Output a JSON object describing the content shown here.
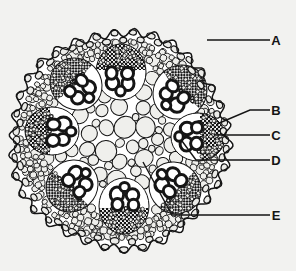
{
  "figure": {
    "background_color": "#f2f2f0",
    "ink_color": "#151515",
    "stem": {
      "center_x": 119,
      "center_y": 140,
      "radius": 108,
      "outline_lobes": 34,
      "lobe_amplitude": 4
    },
    "tissues": [
      {
        "name": "epidermis",
        "description": "outer ring of small flattened cells",
        "cell_count": 74
      },
      {
        "name": "cortex",
        "description": "band of small rounded parenchyma cells beneath epidermis"
      },
      {
        "name": "ground-tissue",
        "description": "large rounded parenchyma cells filling interior"
      },
      {
        "name": "pith",
        "description": "central region of largest parenchyma cells"
      }
    ],
    "vascular_bundles": {
      "count": 8,
      "arrangement": "ring",
      "ring_radius": 66,
      "parts": [
        "sclerenchyma cap (stippled)",
        "xylem vessels (large, white, thick outline)",
        "phloem"
      ],
      "positions": [
        {
          "id": "bundle-n",
          "x": 121,
          "y": 72,
          "angle": -90,
          "rx": 28,
          "ry": 25
        },
        {
          "id": "bundle-ne",
          "x": 180,
          "y": 92,
          "angle": -45,
          "rx": 28,
          "ry": 26
        },
        {
          "id": "bundle-e",
          "x": 198,
          "y": 137,
          "angle": 0,
          "rx": 27,
          "ry": 24
        },
        {
          "id": "bundle-se",
          "x": 175,
          "y": 188,
          "angle": 45,
          "rx": 27,
          "ry": 25
        },
        {
          "id": "bundle-s",
          "x": 124,
          "y": 206,
          "angle": 90,
          "rx": 28,
          "ry": 25
        },
        {
          "id": "bundle-sw",
          "x": 72,
          "y": 186,
          "angle": 135,
          "rx": 27,
          "ry": 25
        },
        {
          "id": "bundle-w",
          "x": 52,
          "y": 131,
          "angle": 180,
          "rx": 27,
          "ry": 24
        },
        {
          "id": "bundle-nw",
          "x": 76,
          "y": 84,
          "angle": -135,
          "rx": 27,
          "ry": 25
        }
      ]
    }
  },
  "labels": [
    {
      "id": "label-a",
      "text": "A",
      "text_x": 276,
      "text_y": 45,
      "leader": "M 207 40 L 270 40",
      "target": "epidermis / outer cell layer"
    },
    {
      "id": "label-b",
      "text": "B",
      "text_x": 276,
      "text_y": 115,
      "leader": "M 217 124 L 250 110 L 270 110",
      "target": "sclerenchyma cap of vascular bundle"
    },
    {
      "id": "label-c",
      "text": "C",
      "text_x": 276,
      "text_y": 140,
      "leader": "M 214 135 L 270 135",
      "target": "xylem vessel"
    },
    {
      "id": "label-d",
      "text": "D",
      "text_x": 276,
      "text_y": 165,
      "leader": "M 182 141 L 196 160 L 270 160",
      "target": "phloem"
    },
    {
      "id": "label-e",
      "text": "E",
      "text_x": 276,
      "text_y": 220,
      "leader": "M 143 162 L 172 215 L 270 215",
      "target": "ground tissue / pith parenchyma"
    }
  ]
}
